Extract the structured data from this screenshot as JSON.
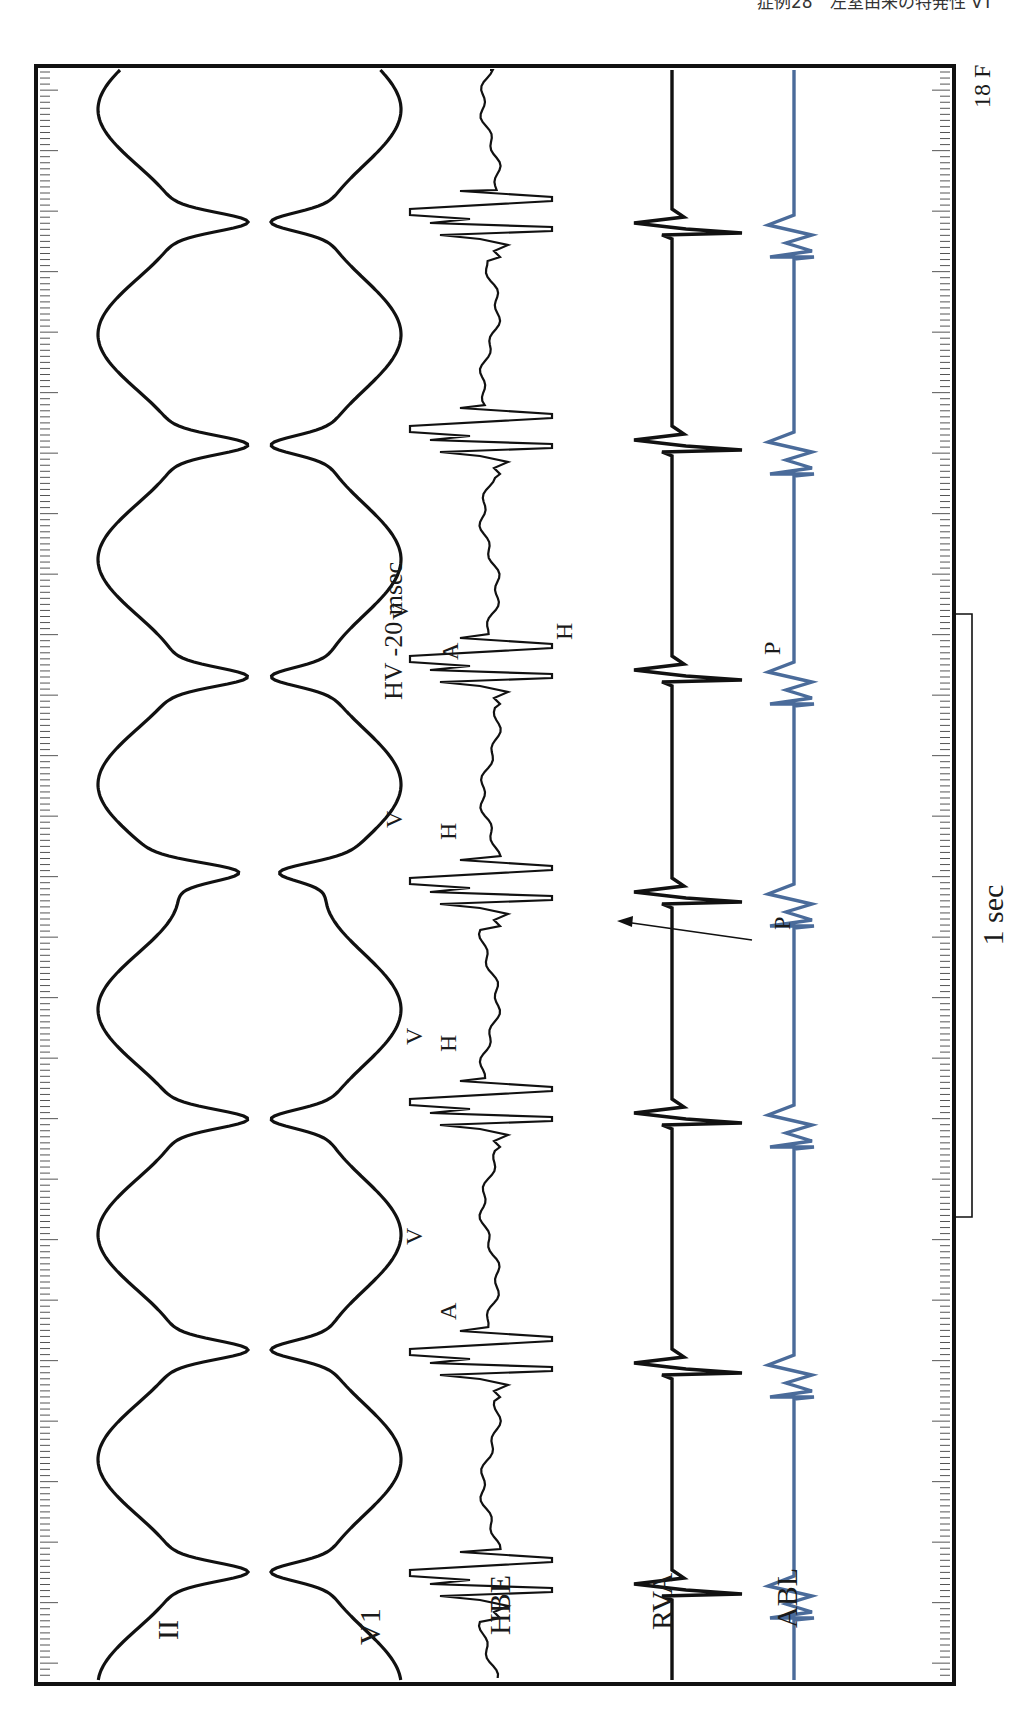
{
  "header": {
    "caption": "症例28　左室由来の特発性 VT"
  },
  "figure": {
    "frame": {
      "left": 36,
      "right": 954,
      "top": 66,
      "bottom": 1684
    },
    "catheter_size_label": "18 F",
    "time_scale": {
      "label": "1 sec",
      "y_start": 614,
      "y_end": 1217,
      "x": 972
    },
    "colors": {
      "trace": "#111111",
      "ablation_trace": "#4a6b9a",
      "frame": "#111111",
      "ruler": "#555555"
    },
    "leads": [
      {
        "id": "II",
        "label": "II",
        "x": 178,
        "label_y": 1640,
        "label_x": 178,
        "type": "ecg_ii"
      },
      {
        "id": "V1",
        "label": "V1",
        "x": 326,
        "label_y": 1645,
        "label_x": 380,
        "type": "ecg_v1"
      },
      {
        "id": "HBE",
        "label": "HBE",
        "x": 490,
        "label_y": 1635,
        "label_x": 510,
        "type": "hbe"
      },
      {
        "id": "RVA",
        "label": "RVA",
        "x": 672,
        "label_y": 1630,
        "label_x": 672,
        "type": "rva"
      },
      {
        "id": "ABL",
        "label": "ABL",
        "x": 794,
        "label_y": 1628,
        "label_x": 797,
        "type": "abl"
      }
    ],
    "beats_y": [
      191,
      408,
      638,
      860,
      1081,
      1331,
      1552
    ],
    "qrs_peak_y": [
      222,
      445,
      677,
      872,
      1119,
      1350,
      1572
    ],
    "annotations": [
      {
        "text": "HV -20 msec",
        "x": 402,
        "y": 700,
        "size": 26
      },
      {
        "text": "V",
        "x": 408,
        "y": 620,
        "size": 24
      },
      {
        "text": "A",
        "x": 458,
        "y": 660,
        "size": 24
      },
      {
        "text": "H",
        "x": 572,
        "y": 640,
        "size": 24
      },
      {
        "text": "P",
        "x": 780,
        "y": 655,
        "size": 24
      },
      {
        "text": "V",
        "x": 402,
        "y": 828,
        "size": 24
      },
      {
        "text": "H",
        "x": 456,
        "y": 840,
        "size": 24
      },
      {
        "text": "P",
        "x": 790,
        "y": 930,
        "size": 24
      },
      {
        "text": "V",
        "x": 422,
        "y": 1045,
        "size": 24
      },
      {
        "text": "H",
        "x": 456,
        "y": 1052,
        "size": 24
      },
      {
        "text": "V",
        "x": 422,
        "y": 1245,
        "size": 24
      },
      {
        "text": "A",
        "x": 456,
        "y": 1320,
        "size": 24
      }
    ],
    "arrow": {
      "x1": 752,
      "y1": 940,
      "x2": 617,
      "y2": 921
    }
  }
}
